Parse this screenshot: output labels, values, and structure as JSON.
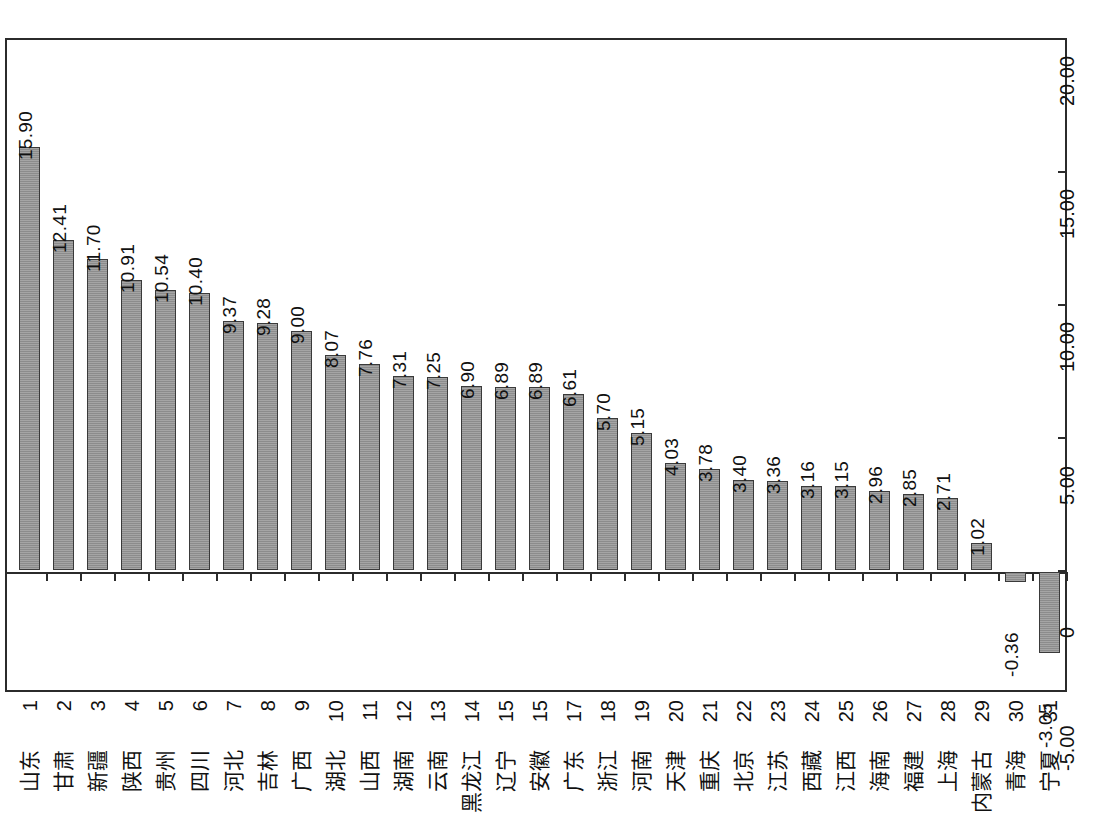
{
  "chart_data": {
    "type": "bar",
    "title": "",
    "subtitle": "",
    "xlabel": "",
    "ylabel": "",
    "ylim": [
      -5.0,
      20.0
    ],
    "ytick_labels": [
      "20.00",
      "15.00",
      "10.00",
      "5.00",
      "0",
      "-5.00"
    ],
    "ytick_values": [
      20.0,
      15.0,
      10.0,
      5.0,
      0,
      -5.0
    ],
    "grid": false,
    "legend": "none",
    "axis_position": "right",
    "label_orientation": "rotated-90",
    "bar_color": "#8c8c8c",
    "bar_border_color": "#3a3a3a",
    "categories": [
      "山东",
      "甘肃",
      "新疆",
      "陕西",
      "贵州",
      "四川",
      "河北",
      "吉林",
      "广西",
      "湖北",
      "山西",
      "湖南",
      "云南",
      "黑龙江",
      "辽宁",
      "安徽",
      "广东",
      "浙江",
      "河南",
      "天津",
      "重庆",
      "北京",
      "江苏",
      "西藏",
      "江西",
      "海南",
      "福建",
      "上海",
      "内蒙古",
      "青海",
      "宁夏"
    ],
    "ranks": [
      "1",
      "2",
      "3",
      "4",
      "5",
      "6",
      "7",
      "8",
      "9",
      "10",
      "11",
      "12",
      "13",
      "14",
      "15",
      "15",
      "17",
      "18",
      "19",
      "20",
      "21",
      "22",
      "23",
      "24",
      "25",
      "26",
      "27",
      "28",
      "29",
      "30",
      "31"
    ],
    "values": [
      15.9,
      12.41,
      11.7,
      10.91,
      10.54,
      10.4,
      9.37,
      9.28,
      9.0,
      8.07,
      7.76,
      7.31,
      7.25,
      6.9,
      6.89,
      6.89,
      6.61,
      5.7,
      5.15,
      4.03,
      3.78,
      3.4,
      3.36,
      3.16,
      3.15,
      2.96,
      2.85,
      2.71,
      1.02,
      -0.36,
      -3.05
    ],
    "value_labels": [
      "15.90",
      "12.41",
      "11.70",
      "10.91",
      "10.54",
      "10.40",
      "9.37",
      "9.28",
      "9.00",
      "8.07",
      "7.76",
      "7.31",
      "7.25",
      "6.90",
      "6.89",
      "6.89",
      "6.61",
      "5.70",
      "5.15",
      "4.03",
      "3.78",
      "3.40",
      "3.36",
      "3.16",
      "3.15",
      "2.96",
      "2.85",
      "2.71",
      "1.02",
      "-0.36",
      "-3.05"
    ]
  }
}
